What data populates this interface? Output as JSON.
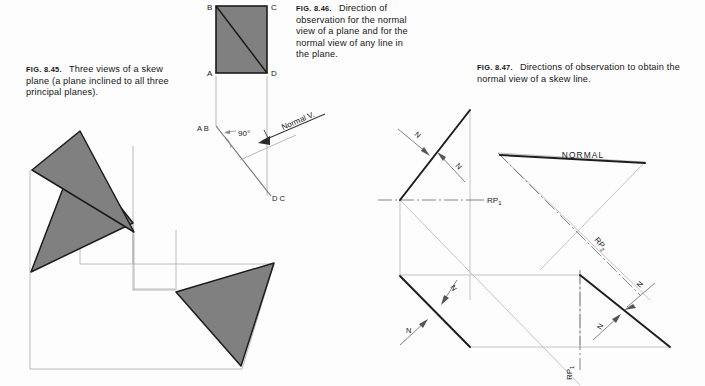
{
  "page": {
    "background": "#fdfdfd",
    "width": 705,
    "height": 386
  },
  "colors": {
    "plane_fill": "#808080",
    "plane_stroke": "#1c1c1c",
    "thin_line": "#9a9a9a",
    "dark_line": "#1e1e1e",
    "text": "#161616"
  },
  "figures": [
    {
      "id": "fig-8-45",
      "number": "FIG. 8.45.",
      "caption_lines": [
        "Three views",
        "of a skew plane (a",
        "plane inclined to all three",
        "principal planes)."
      ],
      "caption_full": "FIG. 8.45.   Three views of a skew plane (a plane inclined to all three principal planes).",
      "views": [
        "top-view",
        "front-view",
        "side-view"
      ]
    },
    {
      "id": "fig-8-46",
      "number": "FIG. 8.46.",
      "caption_lines": [
        "Direction",
        "of observation for the",
        "normal view of a plane",
        "and for the normal",
        "view of any line in the",
        "plane."
      ],
      "caption_full": "FIG. 8.46.   Direction of observation for the normal view of a plane and for the normal view of any line in the plane.",
      "labels": {
        "corner_b": "B",
        "corner_c": "C",
        "corner_a": "A",
        "corner_d": "D",
        "edge_view_left": "A B",
        "edge_view_right": "D C",
        "angle": "90°",
        "normal": "Normal V."
      }
    },
    {
      "id": "fig-8-47",
      "number": "FIG. 8.47.",
      "caption_lines": [
        "Directions of observation",
        "to obtain the normal view of a skew line."
      ],
      "caption_full": "FIG. 8.47.   Directions of observation to obtain the normal view of a skew line.",
      "labels": {
        "normal": "NORMAL",
        "rp_1": "RP",
        "rp_1_sub": "1",
        "rp_2": "RP",
        "rp_2_sub": "2",
        "rp_3": "RP",
        "rp_3_sub": "1",
        "direction": "N"
      },
      "direction_arrow_count": 6
    }
  ]
}
